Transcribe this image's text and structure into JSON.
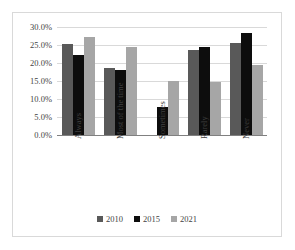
{
  "chart_data": {
    "type": "bar",
    "title": "",
    "subtitle": "",
    "xlabel": "",
    "ylabel": "",
    "categories": [
      "Always",
      "Most of the time",
      "Sometimes",
      "Rarely",
      "Never"
    ],
    "series": [
      {
        "name": "2010",
        "color": "#595959",
        "values": [
          25.4,
          18.5,
          null,
          23.7,
          25.5
        ]
      },
      {
        "name": "2015",
        "color": "#0d0d0d",
        "values": [
          22.3,
          18.0,
          7.9,
          24.5,
          28.4
        ]
      },
      {
        "name": "2021",
        "color": "#a6a6a6",
        "values": [
          27.3,
          24.5,
          15.1,
          14.8,
          19.4
        ]
      }
    ],
    "ylim": [
      0,
      30
    ],
    "ytick_values": [
      0,
      5,
      10,
      15,
      20,
      25,
      30
    ],
    "ytick_labels": [
      "0.0%",
      "5.0%",
      "10.0%",
      "15.0%",
      "20.0%",
      "25.0%",
      "30.0%"
    ],
    "grid": true,
    "grid_axis": "y",
    "legend_position": "bottom",
    "legend_entries": [
      "2010",
      "2015",
      "2021"
    ],
    "xtick_rotation": -90,
    "annotations": []
  },
  "colors": {
    "series_2010": "#595959",
    "series_2015": "#0d0d0d",
    "series_2021": "#a6a6a6",
    "gridline": "#d9d9d9",
    "axis": "#808080",
    "text": "#3f3f3f",
    "border": "#d9d9d9",
    "background": "#ffffff"
  }
}
